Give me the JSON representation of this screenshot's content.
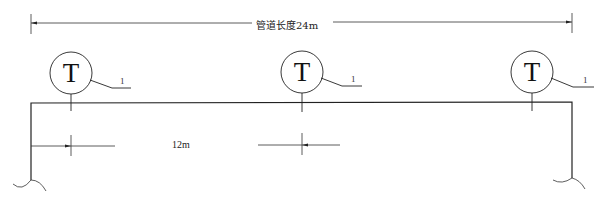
{
  "diagram": {
    "type": "pipe-layout",
    "overall_dimension": {
      "label": "管道长度24m",
      "value_m": 24
    },
    "spacing_dimension": {
      "label": "12m",
      "value_m": 12
    },
    "instruments": [
      {
        "symbol": "T",
        "tag": "1",
        "position": "left"
      },
      {
        "symbol": "T",
        "tag": "1",
        "position": "middle"
      },
      {
        "symbol": "T",
        "tag": "1",
        "position": "right"
      }
    ],
    "colors": {
      "line": "#2a2a2a",
      "background": "#ffffff"
    }
  }
}
